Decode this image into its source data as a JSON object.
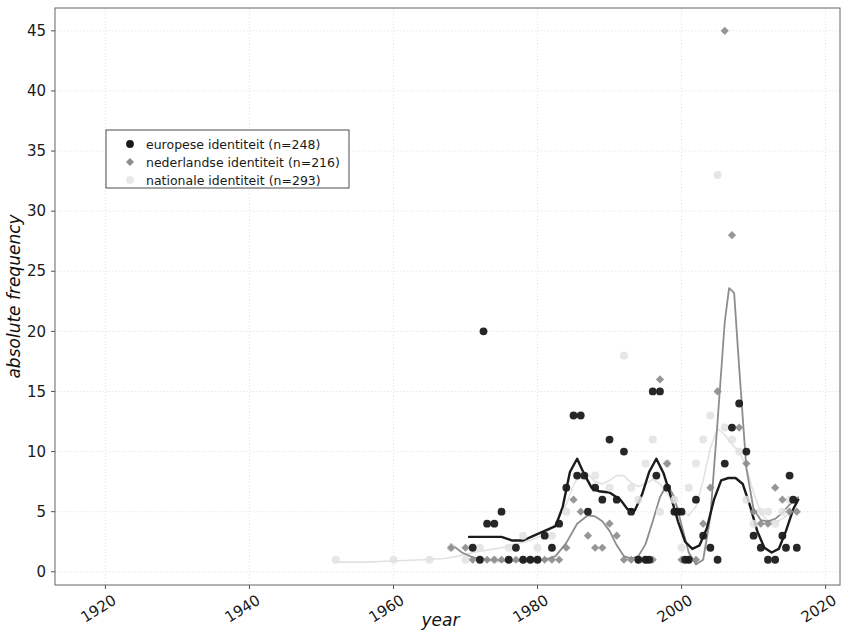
{
  "chart_data": {
    "type": "scatter",
    "title": "",
    "xlabel": "year",
    "ylabel": "absolute frequency",
    "xlim": [
      1913,
      2022
    ],
    "ylim": [
      -1.1,
      46.9
    ],
    "xticks": [
      1920,
      1940,
      1960,
      1980,
      2000,
      2020
    ],
    "xtick_labels": [
      "1920",
      "1940",
      "1960",
      "1980",
      "2000",
      "2020"
    ],
    "yticks": [
      0,
      5,
      10,
      15,
      20,
      25,
      30,
      35,
      40,
      45
    ],
    "ytick_labels": [
      "0",
      "5",
      "10",
      "15",
      "20",
      "25",
      "30",
      "35",
      "40",
      "45"
    ],
    "grid": true,
    "legend_position": "upper left",
    "colors": {
      "europese": "#1b1b1b",
      "nederlandse": "#8d8d8d",
      "nationale": "#e2e2e2",
      "grid": "#d6d6d6",
      "axis": "#555555",
      "background": "#ffffff"
    },
    "series": [
      {
        "name": "europese identiteit (n=248)",
        "legend_label": "europese identiteit (n=248)",
        "marker": "circle",
        "color": "#1b1b1b",
        "points": [
          [
            1971,
            2
          ],
          [
            1972,
            1
          ],
          [
            1972.5,
            20
          ],
          [
            1973,
            4
          ],
          [
            1974,
            4
          ],
          [
            1975,
            5
          ],
          [
            1976,
            1
          ],
          [
            1977,
            2
          ],
          [
            1978,
            1
          ],
          [
            1979,
            1
          ],
          [
            1980,
            1
          ],
          [
            1981,
            3
          ],
          [
            1982,
            2
          ],
          [
            1983,
            4
          ],
          [
            1984,
            7
          ],
          [
            1985,
            13
          ],
          [
            1986,
            13
          ],
          [
            1985.5,
            8
          ],
          [
            1986.5,
            8
          ],
          [
            1987,
            5
          ],
          [
            1988,
            7
          ],
          [
            1989,
            6
          ],
          [
            1990,
            11
          ],
          [
            1991,
            6
          ],
          [
            1992,
            10
          ],
          [
            1993,
            5
          ],
          [
            1994,
            1
          ],
          [
            1995,
            1
          ],
          [
            1995.5,
            1
          ],
          [
            1996,
            15
          ],
          [
            1997,
            15
          ],
          [
            1996.5,
            8
          ],
          [
            1998,
            7
          ],
          [
            1999,
            5
          ],
          [
            1999.5,
            5
          ],
          [
            2000,
            5
          ],
          [
            2000.5,
            1
          ],
          [
            2001,
            1
          ],
          [
            2002,
            6
          ],
          [
            2003,
            3
          ],
          [
            2004,
            2
          ],
          [
            2005,
            1
          ],
          [
            2006,
            9
          ],
          [
            2007,
            12
          ],
          [
            2008,
            14
          ],
          [
            2009,
            10
          ],
          [
            2010,
            3
          ],
          [
            2011,
            2
          ],
          [
            2012,
            1
          ],
          [
            2013,
            1
          ],
          [
            2014,
            3
          ],
          [
            2014.5,
            2
          ],
          [
            2015,
            8
          ],
          [
            2015.5,
            6
          ],
          [
            2016,
            2
          ]
        ]
      },
      {
        "name": "nederlandse identiteit (n=216)",
        "legend_label": "nederlandse identiteit (n=216)",
        "marker": "diamond",
        "color": "#8d8d8d",
        "points": [
          [
            1968,
            2
          ],
          [
            1970,
            2
          ],
          [
            1971,
            1
          ],
          [
            1972,
            1
          ],
          [
            1973,
            1
          ],
          [
            1974,
            1
          ],
          [
            1975,
            1
          ],
          [
            1976,
            1
          ],
          [
            1977,
            1
          ],
          [
            1978,
            1
          ],
          [
            1979,
            1
          ],
          [
            1980,
            1
          ],
          [
            1981,
            1
          ],
          [
            1982,
            1
          ],
          [
            1983,
            1
          ],
          [
            1984,
            2
          ],
          [
            1985,
            6
          ],
          [
            1986,
            5
          ],
          [
            1987,
            3
          ],
          [
            1988,
            2
          ],
          [
            1989,
            2
          ],
          [
            1990,
            4
          ],
          [
            1991,
            3
          ],
          [
            1992,
            1
          ],
          [
            1993,
            1
          ],
          [
            1994,
            1
          ],
          [
            1995,
            1
          ],
          [
            1996,
            1
          ],
          [
            1997,
            16
          ],
          [
            1998,
            9
          ],
          [
            1999,
            5
          ],
          [
            2000,
            1
          ],
          [
            2001,
            1
          ],
          [
            2002,
            1
          ],
          [
            2003,
            4
          ],
          [
            2004,
            7
          ],
          [
            2005,
            15
          ],
          [
            2006,
            45
          ],
          [
            2007,
            28
          ],
          [
            2008,
            12
          ],
          [
            2009,
            9
          ],
          [
            2010,
            5
          ],
          [
            2011,
            4
          ],
          [
            2012,
            4
          ],
          [
            2013,
            7
          ],
          [
            2014,
            6
          ],
          [
            2015,
            5
          ],
          [
            2016,
            5
          ]
        ]
      },
      {
        "name": "nationale identiteit (n=293)",
        "legend_label": "nationale identiteit (n=293)",
        "marker": "circle-light",
        "color": "#e2e2e2",
        "points": [
          [
            1952,
            1
          ],
          [
            1960,
            1
          ],
          [
            1965,
            1
          ],
          [
            1968,
            2
          ],
          [
            1970,
            1
          ],
          [
            1972,
            2
          ],
          [
            1974,
            1
          ],
          [
            1976,
            2
          ],
          [
            1978,
            3
          ],
          [
            1980,
            2
          ],
          [
            1982,
            3
          ],
          [
            1984,
            5
          ],
          [
            1986,
            8
          ],
          [
            1988,
            8
          ],
          [
            1990,
            7
          ],
          [
            1992,
            18
          ],
          [
            1993,
            7
          ],
          [
            1994,
            6
          ],
          [
            1995,
            9
          ],
          [
            1996,
            11
          ],
          [
            1997,
            5
          ],
          [
            1998,
            9
          ],
          [
            1999,
            6
          ],
          [
            2000,
            2
          ],
          [
            2001,
            7
          ],
          [
            2002,
            9
          ],
          [
            2003,
            11
          ],
          [
            2004,
            13
          ],
          [
            2005,
            33
          ],
          [
            2006,
            12
          ],
          [
            2007,
            11
          ],
          [
            2008,
            10
          ],
          [
            2009,
            6
          ],
          [
            2010,
            4
          ],
          [
            2011,
            5
          ],
          [
            2012,
            5
          ],
          [
            2013,
            4
          ],
          [
            2014,
            5
          ],
          [
            2015,
            6
          ]
        ]
      }
    ],
    "trend_lines": [
      {
        "name": "europese identiteit trend",
        "color": "#1b1b1b",
        "width": 2.4,
        "points": [
          [
            1970.5,
            2.9
          ],
          [
            1972,
            2.9
          ],
          [
            1973.5,
            2.9
          ],
          [
            1975,
            2.9
          ],
          [
            1976.5,
            2.6
          ],
          [
            1978,
            2.6
          ],
          [
            1979.5,
            3.0
          ],
          [
            1981,
            3.4
          ],
          [
            1982.5,
            3.8
          ],
          [
            1983.5,
            5.4
          ],
          [
            1984.5,
            8.3
          ],
          [
            1985.5,
            9.4
          ],
          [
            1986.5,
            8.1
          ],
          [
            1987.5,
            7.0
          ],
          [
            1988.5,
            6.7
          ],
          [
            1990,
            6.6
          ],
          [
            1991.5,
            6.0
          ],
          [
            1992.5,
            5.2
          ],
          [
            1993.5,
            5.1
          ],
          [
            1994.5,
            6.4
          ],
          [
            1995.5,
            8.3
          ],
          [
            1996.5,
            9.4
          ],
          [
            1997.5,
            8.2
          ],
          [
            1998.5,
            6.3
          ],
          [
            1999.5,
            4.2
          ],
          [
            2000.5,
            2.5
          ],
          [
            2001.5,
            1.9
          ],
          [
            2002.5,
            2.2
          ],
          [
            2003.5,
            3.6
          ],
          [
            2004.5,
            6.0
          ],
          [
            2005.5,
            7.6
          ],
          [
            2006.5,
            7.8
          ],
          [
            2007.5,
            7.8
          ],
          [
            2008.5,
            7.3
          ],
          [
            2009.5,
            5.5
          ],
          [
            2010.5,
            3.4
          ],
          [
            2011.5,
            2.0
          ],
          [
            2012.5,
            1.6
          ],
          [
            2013.5,
            1.9
          ],
          [
            2014.5,
            3.4
          ],
          [
            2015.5,
            5.2
          ],
          [
            2016.2,
            6.0
          ]
        ]
      },
      {
        "name": "nederlandse identiteit trend",
        "color": "#8d8d8d",
        "width": 1.8,
        "points": [
          [
            1968,
            2.3
          ],
          [
            1969.5,
            1.6
          ],
          [
            1971,
            1.2
          ],
          [
            1973,
            1.0
          ],
          [
            1975,
            0.9
          ],
          [
            1977,
            0.9
          ],
          [
            1979,
            0.9
          ],
          [
            1981,
            1.0
          ],
          [
            1982.5,
            1.3
          ],
          [
            1984,
            2.4
          ],
          [
            1985.5,
            4.0
          ],
          [
            1987,
            4.7
          ],
          [
            1988,
            4.6
          ],
          [
            1989,
            4.2
          ],
          [
            1990,
            3.4
          ],
          [
            1991,
            2.2
          ],
          [
            1992,
            1.3
          ],
          [
            1993,
            1.1
          ],
          [
            1994,
            1.3
          ],
          [
            1995,
            2.3
          ],
          [
            1996,
            4.2
          ],
          [
            1997,
            6.2
          ],
          [
            1998,
            7.3
          ],
          [
            1999,
            6.2
          ],
          [
            2000,
            3.9
          ],
          [
            2001,
            1.6
          ],
          [
            2002,
            0.6
          ],
          [
            2003,
            1.0
          ],
          [
            2004,
            4.6
          ],
          [
            2005,
            12.5
          ],
          [
            2006,
            20.8
          ],
          [
            2006.6,
            23.6
          ],
          [
            2007.3,
            23.2
          ],
          [
            2008,
            17.0
          ],
          [
            2009,
            8.6
          ],
          [
            2010,
            5.2
          ],
          [
            2011,
            4.3
          ],
          [
            2012,
            4.2
          ],
          [
            2013,
            4.4
          ],
          [
            2014,
            4.9
          ],
          [
            2015,
            5.6
          ],
          [
            2016.2,
            6.2
          ]
        ]
      },
      {
        "name": "nationale identiteit trend",
        "color": "#e2e2e2",
        "width": 1.6,
        "points": [
          [
            1952,
            0.8
          ],
          [
            1956,
            0.8
          ],
          [
            1960,
            0.9
          ],
          [
            1964,
            1.0
          ],
          [
            1967,
            1.1
          ],
          [
            1969,
            1.3
          ],
          [
            1971,
            1.6
          ],
          [
            1973,
            1.8
          ],
          [
            1975,
            2.0
          ],
          [
            1977,
            2.3
          ],
          [
            1979,
            2.6
          ],
          [
            1981,
            3.1
          ],
          [
            1982.5,
            4.0
          ],
          [
            1984,
            5.6
          ],
          [
            1985,
            7.2
          ],
          [
            1986,
            8.3
          ],
          [
            1987,
            8.1
          ],
          [
            1988,
            7.5
          ],
          [
            1989,
            7.3
          ],
          [
            1990,
            7.6
          ],
          [
            1991,
            8.0
          ],
          [
            1992,
            8.0
          ],
          [
            1993,
            7.4
          ],
          [
            1994,
            7.1
          ],
          [
            1995,
            7.3
          ],
          [
            1996,
            7.7
          ],
          [
            1997,
            7.3
          ],
          [
            1998,
            6.5
          ],
          [
            1999,
            5.7
          ],
          [
            2000,
            5.0
          ],
          [
            2001,
            4.7
          ],
          [
            2002,
            5.4
          ],
          [
            2003,
            7.6
          ],
          [
            2004,
            10.3
          ],
          [
            2005,
            11.9
          ],
          [
            2006,
            11.4
          ],
          [
            2007,
            10.6
          ],
          [
            2008,
            10.0
          ],
          [
            2009,
            8.7
          ],
          [
            2010,
            6.6
          ],
          [
            2011,
            4.9
          ],
          [
            2012,
            4.2
          ],
          [
            2013,
            4.1
          ],
          [
            2014,
            4.4
          ],
          [
            2015,
            4.9
          ],
          [
            2016.2,
            5.2
          ]
        ]
      }
    ]
  },
  "legend": {
    "items": [
      {
        "label": "europese identiteit (n=248)",
        "marker": "circle",
        "color": "#1b1b1b"
      },
      {
        "label": "nederlandse identiteit (n=216)",
        "marker": "diamond",
        "color": "#8d8d8d"
      },
      {
        "label": "nationale identiteit (n=293)",
        "marker": "circle-light",
        "color": "#e8e8e8"
      }
    ]
  },
  "axes": {
    "x_title": "year",
    "y_title": "absolute frequency"
  }
}
